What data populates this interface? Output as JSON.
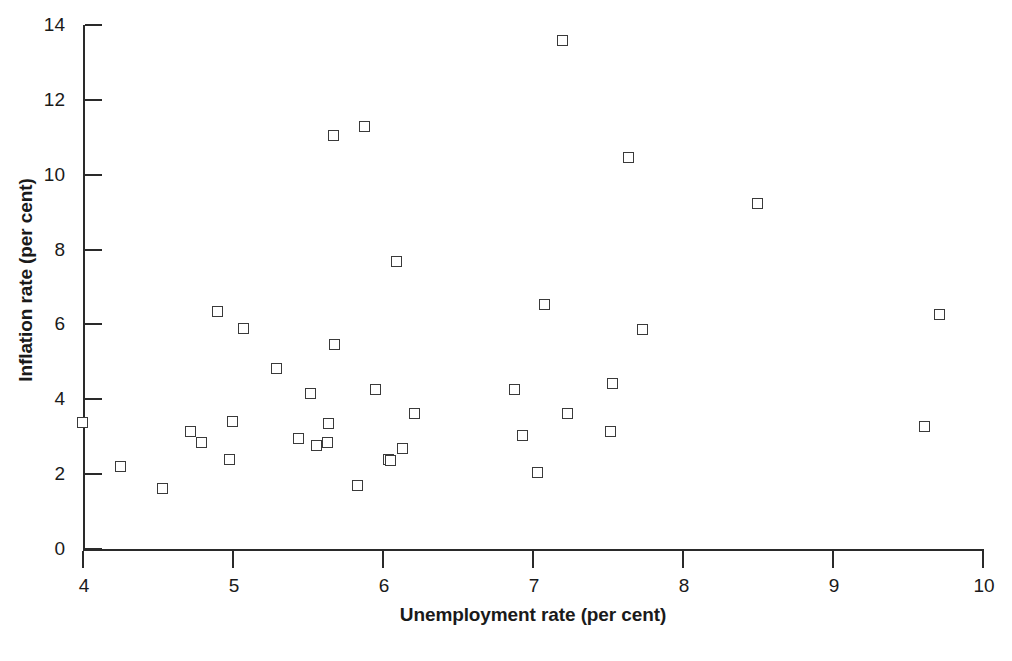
{
  "chart_data": {
    "type": "scatter",
    "title": "",
    "xlabel": "Unemployment rate (per cent)",
    "ylabel": "Inflation rate (per cent)",
    "xlim": [
      4,
      10
    ],
    "ylim": [
      0,
      14
    ],
    "xticks": [
      4,
      5,
      6,
      7,
      8,
      9,
      10
    ],
    "xtick_labels": [
      "4",
      "5",
      "6",
      "7",
      "8",
      "9",
      "10"
    ],
    "yticks": [
      0,
      2,
      4,
      6,
      8,
      10,
      12,
      14
    ],
    "ytick_labels": [
      "0",
      "2",
      "4",
      "6",
      "8",
      "10",
      "12",
      "14"
    ],
    "grid": false,
    "legend": null,
    "marker": "open-square",
    "marker_edge_color": "#3a3a3a",
    "marker_face_color": "#ffffff",
    "n_points": 39,
    "x": [
      4.0,
      4.25,
      4.53,
      4.72,
      4.79,
      4.9,
      4.98,
      5.07,
      5.0,
      5.29,
      5.44,
      5.52,
      5.56,
      5.63,
      5.64,
      5.67,
      5.68,
      5.83,
      5.88,
      5.95,
      6.04,
      6.05,
      6.09,
      6.13,
      6.21,
      6.88,
      6.93,
      7.03,
      7.08,
      7.2,
      7.23,
      7.52,
      7.53,
      7.64,
      7.73,
      8.5,
      9.61,
      9.71,
      5.08
    ],
    "y": [
      3.37,
      2.2,
      1.6,
      3.13,
      2.84,
      6.33,
      2.38,
      5.88,
      3.4,
      4.8,
      2.95,
      4.13,
      2.74,
      2.82,
      3.35,
      11.04,
      5.45,
      1.67,
      11.28,
      4.26,
      2.38,
      2.35,
      7.66,
      2.67,
      3.6,
      4.26,
      3.03,
      2.02,
      6.52,
      13.57,
      3.6,
      3.13,
      4.4,
      10.45,
      5.85,
      9.22,
      3.27,
      6.25,
      3.4
    ],
    "points": [
      {
        "x": 4.0,
        "y": 3.37
      },
      {
        "x": 4.25,
        "y": 2.2
      },
      {
        "x": 4.53,
        "y": 1.6
      },
      {
        "x": 4.72,
        "y": 3.13
      },
      {
        "x": 4.79,
        "y": 2.84
      },
      {
        "x": 4.9,
        "y": 6.33
      },
      {
        "x": 4.98,
        "y": 2.38
      },
      {
        "x": 5.0,
        "y": 3.4
      },
      {
        "x": 5.07,
        "y": 5.88
      },
      {
        "x": 5.29,
        "y": 4.8
      },
      {
        "x": 5.44,
        "y": 2.95
      },
      {
        "x": 5.52,
        "y": 4.13
      },
      {
        "x": 5.56,
        "y": 2.74
      },
      {
        "x": 5.63,
        "y": 2.82
      },
      {
        "x": 5.64,
        "y": 3.35
      },
      {
        "x": 5.67,
        "y": 11.04
      },
      {
        "x": 5.68,
        "y": 5.45
      },
      {
        "x": 5.83,
        "y": 1.67
      },
      {
        "x": 5.88,
        "y": 11.28
      },
      {
        "x": 5.95,
        "y": 4.26
      },
      {
        "x": 6.04,
        "y": 2.38
      },
      {
        "x": 6.05,
        "y": 2.35
      },
      {
        "x": 6.09,
        "y": 7.66
      },
      {
        "x": 6.13,
        "y": 2.67
      },
      {
        "x": 6.21,
        "y": 3.6
      },
      {
        "x": 6.88,
        "y": 4.26
      },
      {
        "x": 6.93,
        "y": 3.03
      },
      {
        "x": 7.03,
        "y": 2.02
      },
      {
        "x": 7.08,
        "y": 6.52
      },
      {
        "x": 7.2,
        "y": 13.57
      },
      {
        "x": 7.23,
        "y": 3.6
      },
      {
        "x": 7.52,
        "y": 3.13
      },
      {
        "x": 7.53,
        "y": 4.4
      },
      {
        "x": 7.64,
        "y": 10.45
      },
      {
        "x": 7.73,
        "y": 5.85
      },
      {
        "x": 8.5,
        "y": 9.22
      },
      {
        "x": 9.61,
        "y": 3.27
      },
      {
        "x": 9.71,
        "y": 6.25
      }
    ]
  }
}
